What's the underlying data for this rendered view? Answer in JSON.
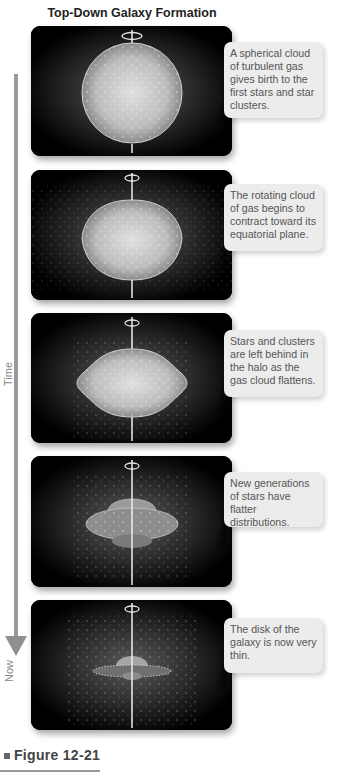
{
  "figure": {
    "title": "Top-Down Galaxy Formation",
    "caption_label": "Figure 12-21",
    "timeline": {
      "start_label": "Time",
      "end_label": "Now",
      "arrow_color": "#8f8f8f"
    },
    "panels": [
      {
        "stage": 1,
        "shape": "sphere",
        "description": "A spherical cloud of turbulent gas gives birth to the first stars and star clusters."
      },
      {
        "stage": 2,
        "shape": "contracting-sphere",
        "description": "The rotating cloud of gas begins to contract toward its equatorial plane."
      },
      {
        "stage": 3,
        "shape": "flattening-cloud",
        "description": "Stars and clusters are left behind in the halo as the gas cloud flattens."
      },
      {
        "stage": 4,
        "shape": "flattened-disk",
        "description": "New generations of stars have flatter distributions."
      },
      {
        "stage": 5,
        "shape": "thin-disk",
        "description": "The disk of the galaxy is now very thin."
      }
    ],
    "colors": {
      "panel_bg": "#000000",
      "callout_bg": "#ececec",
      "callout_text": "#555555",
      "axis": "#e8e8e8"
    }
  }
}
